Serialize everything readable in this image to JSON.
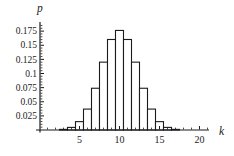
{
  "figure": {
    "background": "#ffffff",
    "line_color": "#1b1b1b",
    "text_color": "#1b1b1b",
    "bar_fill": "#ffffff"
  },
  "chart_data": {
    "type": "bar",
    "title": "",
    "xlabel": "k",
    "ylabel": "p",
    "categories": [
      3,
      4,
      5,
      6,
      7,
      8,
      9,
      10,
      11,
      12,
      13,
      14,
      15,
      16,
      17
    ],
    "values": [
      0.0011,
      0.0046,
      0.0148,
      0.037,
      0.0739,
      0.1201,
      0.1602,
      0.1762,
      0.1602,
      0.1201,
      0.0739,
      0.037,
      0.0148,
      0.0046,
      0.0011
    ],
    "bar_width": 1,
    "xlim": [
      0,
      21.5
    ],
    "ylim": [
      0,
      0.19
    ],
    "x_ticks": [
      5,
      10,
      15,
      20
    ],
    "x_tick_labels": [
      "5",
      "10",
      "15",
      "20"
    ],
    "y_ticks": [
      0.025,
      0.05,
      0.075,
      0.1,
      0.125,
      0.15,
      0.175
    ],
    "y_tick_labels": [
      "0.025",
      "0.05",
      "0.075",
      "0.1",
      "0.125",
      "0.15",
      "0.175"
    ],
    "x_minor_tick_step": 1,
    "y_minor_tick_step": 0.005,
    "grid": false,
    "legend": null
  }
}
